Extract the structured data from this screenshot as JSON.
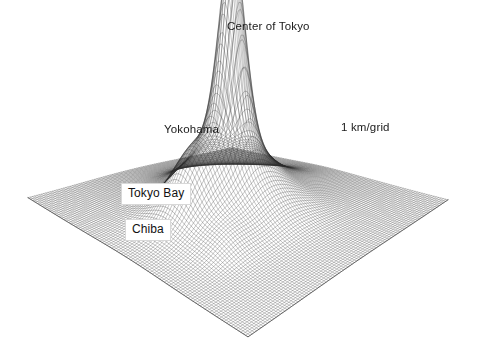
{
  "figure": {
    "width": 478,
    "height": 355,
    "background": "#ffffff",
    "ink_color": "#2b2b2b"
  },
  "labels": {
    "center_of_tokyo": "Center of Tokyo",
    "yokohama": "Yokohama",
    "scale": "1 km/grid",
    "tokyo_bay": "Tokyo Bay",
    "chiba": "Chiba"
  },
  "chart_data": {
    "type": "surface",
    "title": "",
    "subtitle": "",
    "xlabel": "",
    "ylabel": "",
    "zlabel": "",
    "grid": true,
    "legend_position": "none",
    "grid_spacing_label": "1 km/grid",
    "annotations": [
      {
        "text": "Center of Tokyo",
        "style": "plain",
        "anchor_u": 0.51,
        "anchor_v": 0.47,
        "px": 227,
        "py": 20
      },
      {
        "text": "Yokohama",
        "style": "plain",
        "anchor_u": 0.3,
        "anchor_v": 0.4,
        "px": 164,
        "py": 123
      },
      {
        "text": "1 km/grid",
        "style": "plain",
        "anchor_u": 0.8,
        "anchor_v": 0.3,
        "px": 341,
        "py": 121
      },
      {
        "text": "Tokyo Bay",
        "style": "boxed",
        "anchor_u": 0.33,
        "anchor_v": 0.55,
        "px": 121,
        "py": 183
      },
      {
        "text": "Chiba",
        "style": "boxed",
        "anchor_u": 0.3,
        "anchor_v": 0.7,
        "px": 125,
        "py": 219
      }
    ],
    "projection": {
      "kind": "isometric-wireframe",
      "corner_left": [
        28,
        198
      ],
      "corner_back": [
        232,
        148
      ],
      "corner_right": [
        448,
        200
      ],
      "corner_front": [
        248,
        337
      ],
      "z_scale_px": 190,
      "mesh_rows": 92,
      "mesh_cols": 92,
      "line_width": 0.38
    },
    "axis_ranges": {
      "u": [
        0,
        1
      ],
      "v": [
        0,
        1
      ],
      "z": [
        0,
        1
      ]
    },
    "surface_model": {
      "note": "sum of gaussian bumps; u,v in 0..1 grid coordinates, amplitude normalized to peak 1.0",
      "bumps": [
        {
          "name": "Center of Tokyo",
          "u": 0.515,
          "v": 0.455,
          "amp": 1.0,
          "su": 0.042,
          "sv": 0.042
        },
        {
          "name": "Tokyo inner ring",
          "u": 0.515,
          "v": 0.455,
          "amp": 0.26,
          "su": 0.115,
          "sv": 0.115
        },
        {
          "name": "Tokyo broad halo",
          "u": 0.515,
          "v": 0.46,
          "amp": 0.11,
          "su": 0.24,
          "sv": 0.235
        },
        {
          "name": "Yokohama",
          "u": 0.325,
          "v": 0.43,
          "amp": 0.165,
          "su": 0.07,
          "sv": 0.062
        },
        {
          "name": "Yokohama skirt",
          "u": 0.32,
          "v": 0.45,
          "amp": 0.075,
          "su": 0.135,
          "sv": 0.12
        },
        {
          "name": "Kawasaki saddle",
          "u": 0.415,
          "v": 0.44,
          "amp": 0.06,
          "su": 0.06,
          "sv": 0.055
        },
        {
          "name": "Chiba",
          "u": 0.3,
          "v": 0.64,
          "amp": 0.048,
          "su": 0.075,
          "sv": 0.06
        },
        {
          "name": "Saitama north",
          "u": 0.6,
          "v": 0.3,
          "amp": 0.075,
          "su": 0.11,
          "sv": 0.09
        },
        {
          "name": "East ridge",
          "u": 0.72,
          "v": 0.42,
          "amp": 0.055,
          "su": 0.12,
          "sv": 0.09
        },
        {
          "name": "South ridge",
          "u": 0.56,
          "v": 0.6,
          "amp": 0.042,
          "su": 0.12,
          "sv": 0.1
        }
      ],
      "depressions": [
        {
          "name": "Tokyo Bay",
          "u": 0.395,
          "v": 0.57,
          "amp": 0.03,
          "su": 0.09,
          "sv": 0.11
        }
      ],
      "base_level": 0.0,
      "peak_value_normalized": 1.0
    }
  }
}
